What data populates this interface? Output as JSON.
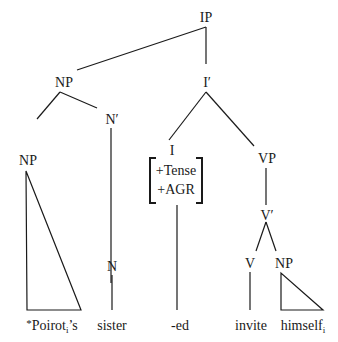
{
  "diagram": {
    "type": "syntax-tree",
    "nodes": {
      "ip": "IP",
      "np_subject": "NP",
      "np_possessor": "NP",
      "n_bar": "N′",
      "n": "N",
      "i_bar": "I′",
      "i": "I",
      "i_features": [
        "+Tense",
        "+AGR"
      ],
      "vp": "VP",
      "v_bar": "V′",
      "v": "V",
      "np_object": "NP"
    },
    "leaves": {
      "possessor": {
        "star": "*",
        "base": "Poirot",
        "index": "i",
        "suffix": "’s"
      },
      "noun": "sister",
      "inflection": "-ed",
      "verb": "invite",
      "reflexive": {
        "base": "himself",
        "index": "i"
      }
    }
  }
}
